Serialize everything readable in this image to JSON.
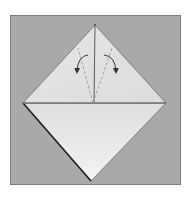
{
  "diagram": {
    "type": "origami-step",
    "colors": {
      "page_background": "#ffffff",
      "panel_background": "#a9a9a9",
      "panel_border": "#7a7a7a",
      "paper_top_triangle": "#e2e2e2",
      "paper_bottom_light": "#f1f1f1",
      "paper_bottom_dark": "#d9d9d9",
      "edge_line": "#5a5a5a",
      "thick_edge": "#1e1e1e",
      "fold_line": "#9a9a9a",
      "arrow": "#333333"
    },
    "points": {
      "top": [
        95,
        25
      ],
      "left": [
        23,
        103
      ],
      "right": [
        166,
        103
      ],
      "bottom": [
        91,
        181
      ],
      "center": [
        94,
        103
      ]
    },
    "arrows": [
      {
        "name": "left-fold-arrow",
        "direction": "counter-clockwise",
        "from": [
          88,
          55
        ],
        "to": [
          77,
          71
        ]
      },
      {
        "name": "right-fold-arrow",
        "direction": "clockwise",
        "from": [
          104,
          55
        ],
        "to": [
          116,
          71
        ]
      }
    ],
    "fold_lines": [
      {
        "name": "left-valley-fold",
        "from": [
          93,
          103
        ],
        "to": [
          78,
          48
        ]
      },
      {
        "name": "right-valley-fold",
        "from": [
          93,
          103
        ],
        "to": [
          112,
          48
        ]
      }
    ]
  }
}
